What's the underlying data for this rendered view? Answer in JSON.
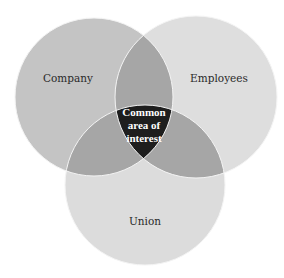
{
  "diagram": {
    "type": "venn",
    "sets": [
      {
        "id": "company",
        "label": "Company",
        "color": "#c4c4c4"
      },
      {
        "id": "employees",
        "label": "Employees",
        "color": "#dedede"
      },
      {
        "id": "union",
        "label": "Union",
        "color": "#dcdcdc"
      }
    ],
    "overlaps": {
      "pair_color": "#a6a6a6",
      "center_color": "#1e1e1e",
      "center_label_lines": [
        "Common",
        "area of",
        "interest"
      ]
    }
  }
}
